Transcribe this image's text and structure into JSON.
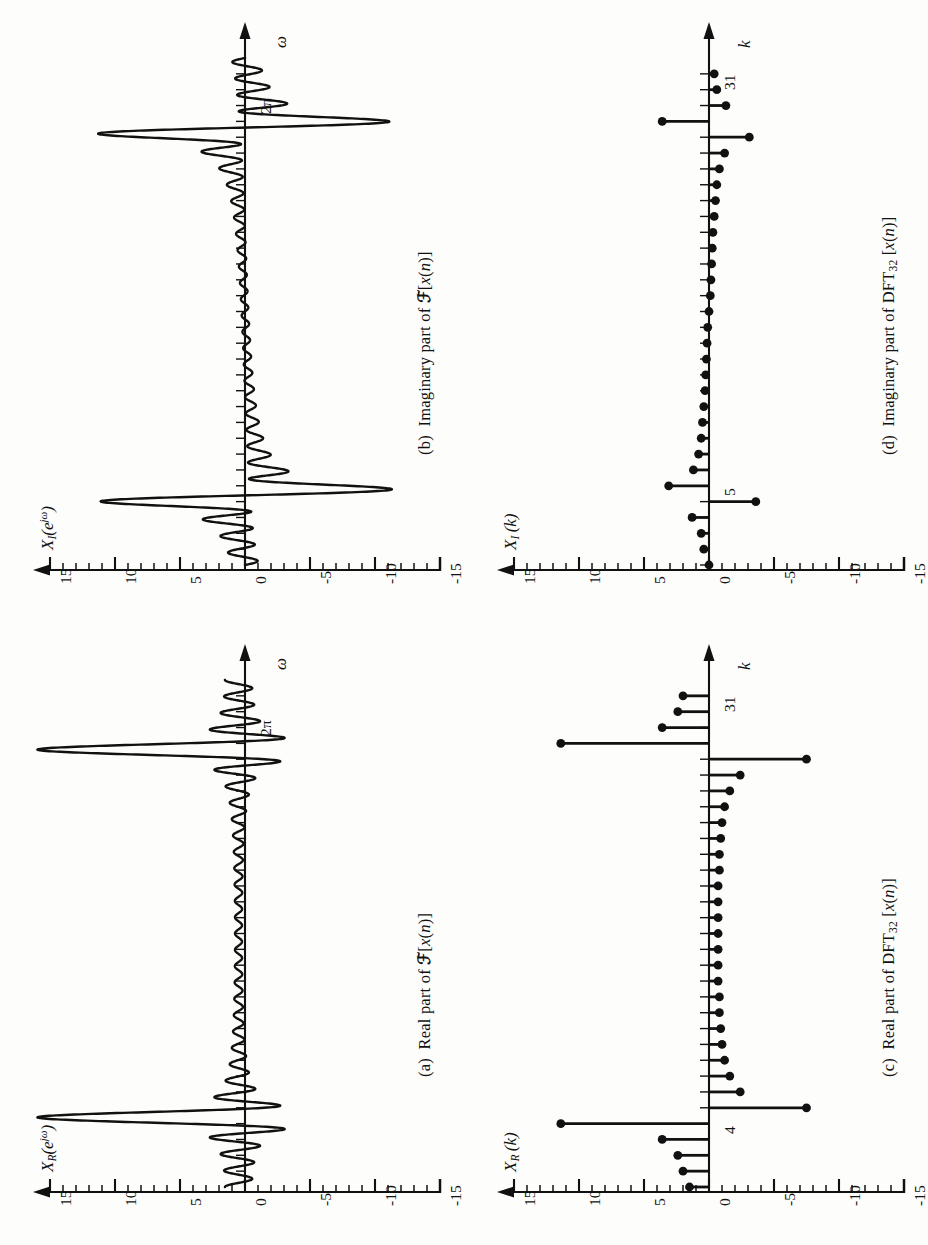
{
  "figure": {
    "orientation": "rotated-90-ccw",
    "panels": [
      {
        "id": "a",
        "caption_index": "(a)",
        "caption_text_before": "Real part of ",
        "caption_operator": "ℱ",
        "caption_text_after": "[x(n)]",
        "caption_full": "(a)  Real part of ℱ[x(n)]",
        "value_axis_label": "X",
        "value_axis_sub": "R",
        "value_axis_arg": "(e",
        "value_axis_exp": "jω",
        "value_axis_close": ")",
        "value_axis_full": "X_R(e^{jω})",
        "freq_axis_label": "ω",
        "freq_tick_label": "2π",
        "type": "continuous"
      },
      {
        "id": "b",
        "caption_index": "(b)",
        "caption_text_before": "Imaginary part of ",
        "caption_operator": "ℱ",
        "caption_text_after": "[x(n)]",
        "caption_full": "(b)  Imaginary part of ℱ[x(n)]",
        "value_axis_label": "X",
        "value_axis_sub": "I",
        "value_axis_arg": "(e",
        "value_axis_exp": "jω",
        "value_axis_close": ")",
        "value_axis_full": "X_I(e^{jω})",
        "freq_axis_label": "ω",
        "freq_tick_label": "2π",
        "type": "continuous"
      },
      {
        "id": "c",
        "caption_index": "(c)",
        "caption_text_before": "Real part of DFT",
        "caption_sub": "32",
        "caption_text_after": " [x(n)]",
        "caption_full": "(c)  Real part of DFT_32 [x(n)]",
        "value_axis_label": "X",
        "value_axis_sub": "R",
        "value_axis_arg": "(k)",
        "value_axis_full": "X_R(k)",
        "freq_axis_label": "k",
        "freq_tick_label": "4",
        "type": "stem"
      },
      {
        "id": "d",
        "caption_index": "(d)",
        "caption_text_before": "Imaginary part of DFT",
        "caption_sub": "32",
        "caption_text_after": " [x(n)]",
        "caption_full": "(d)  Imaginary part of DFT_32 [x(n)]",
        "value_axis_label": "X",
        "value_axis_sub": "I",
        "value_axis_arg": "(k)",
        "value_axis_full": "X_I(k)",
        "freq_axis_label": "k",
        "freq_tick_label": "5",
        "type": "stem"
      }
    ]
  },
  "axis": {
    "value_ticks_major": [
      "15",
      "10",
      "5",
      "0",
      "-5",
      "-10",
      "-15"
    ],
    "value_tick_values": [
      15,
      10,
      5,
      0,
      -5,
      -10,
      -15
    ],
    "value_minor_step": 1,
    "value_min": -15,
    "value_max": 15,
    "arrow_at": "15"
  },
  "chart_data": [
    {
      "type": "line",
      "title": "(a)  Real part of ℱ[x(n)]",
      "xlabel": "ω",
      "ylabel": "X_R(e^{jω})",
      "xlim": [
        0,
        6.2832
      ],
      "ylim": [
        -15,
        15
      ],
      "xtick_labels": [
        "2π"
      ],
      "ytick_labels": [
        "15",
        "10",
        "5",
        "0",
        "-5",
        "-10",
        "-15"
      ],
      "grid": false,
      "legend": null,
      "notes": "Dirichlet-kernel sidelobes, positive main lobe near ω=π/4 reaching about 11 and negative lobe about -11 just past it; mirrored (even) structure near ω=7π/4 with peak about 11 and trough about -10.",
      "annotations": [
        {
          "x": 0.785,
          "y": 11.0,
          "label": "main lobe peak"
        },
        {
          "x": 0.93,
          "y": -11.0,
          "label": "adjacent negative lobe"
        },
        {
          "x": 5.35,
          "y": -10.0,
          "label": "negative lobe"
        },
        {
          "x": 5.5,
          "y": 11.0,
          "label": "main lobe peak"
        }
      ]
    },
    {
      "type": "line",
      "title": "(b)  Imaginary part of ℱ[x(n)]",
      "xlabel": "ω",
      "ylabel": "X_I(e^{jω})",
      "xlim": [
        0,
        6.2832
      ],
      "ylim": [
        -15,
        15
      ],
      "xtick_labels": [
        "2π"
      ],
      "ytick_labels": [
        "15",
        "10",
        "5",
        "0",
        "-5",
        "-10",
        "-15"
      ],
      "grid": false,
      "legend": null,
      "notes": "Odd-symmetric: large negative excursion near -15 around ω=π/4 and large positive excursion near +15 around ω=7π/4, with decaying ripples in between.",
      "annotations": [
        {
          "x": 0.85,
          "y": -15.0,
          "label": "negative peak"
        },
        {
          "x": 5.45,
          "y": 15.0,
          "label": "positive peak"
        }
      ]
    },
    {
      "type": "stem",
      "title": "(c)  Real part of DFT_32 [x(n)]",
      "xlabel": "k",
      "ylabel": "X_R(k)",
      "xlim": [
        0,
        32
      ],
      "ylim": [
        -15,
        15
      ],
      "xtick_labels": [
        "4",
        "31"
      ],
      "ytick_labels": [
        "15",
        "10",
        "5",
        "0",
        "-5",
        "-10",
        "-15"
      ],
      "grid": false,
      "legend": null,
      "x": [
        0,
        1,
        2,
        3,
        4,
        5,
        6,
        7,
        8,
        9,
        10,
        11,
        12,
        13,
        14,
        15,
        16,
        17,
        18,
        19,
        20,
        21,
        22,
        23,
        24,
        25,
        26,
        27,
        28,
        29,
        30,
        31
      ],
      "values": [
        1.5,
        2.0,
        2.4,
        3.6,
        11.4,
        -7.5,
        -2.4,
        -1.6,
        -1.2,
        -1.0,
        -0.9,
        -0.8,
        -0.8,
        -0.7,
        -0.7,
        -0.7,
        -0.7,
        -0.7,
        -0.7,
        -0.7,
        -0.8,
        -0.8,
        -0.9,
        -1.0,
        -1.2,
        -1.6,
        -2.4,
        -7.5,
        11.4,
        3.6,
        2.4,
        2.0
      ]
    },
    {
      "type": "stem",
      "title": "(d)  Imaginary part of DFT_32 [x(n)]",
      "xlabel": "k",
      "ylabel": "X_I(k)",
      "xlim": [
        0,
        32
      ],
      "ylim": [
        -15,
        15
      ],
      "xtick_labels": [
        "5",
        "31"
      ],
      "ytick_labels": [
        "15",
        "10",
        "5",
        "0",
        "-5",
        "-10",
        "-15"
      ],
      "grid": false,
      "legend": null,
      "x": [
        0,
        1,
        2,
        3,
        4,
        5,
        6,
        7,
        8,
        9,
        10,
        11,
        12,
        13,
        14,
        15,
        16,
        17,
        18,
        19,
        20,
        21,
        22,
        23,
        24,
        25,
        26,
        27,
        28,
        29,
        30,
        31
      ],
      "values": [
        0.0,
        0.4,
        0.6,
        1.3,
        -3.6,
        3.1,
        1.2,
        0.8,
        0.6,
        0.5,
        0.4,
        0.3,
        0.25,
        0.2,
        0.15,
        0.1,
        0.0,
        -0.1,
        -0.15,
        -0.2,
        -0.25,
        -0.3,
        -0.4,
        -0.5,
        -0.6,
        -0.8,
        -1.2,
        -3.1,
        3.6,
        -1.3,
        -0.6,
        -0.4
      ]
    }
  ]
}
